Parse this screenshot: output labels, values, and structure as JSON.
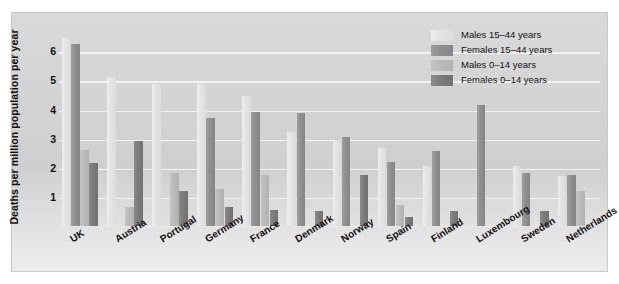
{
  "chart_data": {
    "type": "bar",
    "title": "",
    "xlabel": "",
    "ylabel": "Deaths per million population per year",
    "ylim": [
      0,
      6.8
    ],
    "yticks": [
      "1",
      "2",
      "3",
      "4",
      "5",
      "6"
    ],
    "grid": true,
    "legend_position": "top-right",
    "categories": [
      "UK",
      "Austria",
      "Portugal",
      "Germany",
      "France",
      "Denmark",
      "Norway",
      "Spain",
      "Finland",
      "Luxembourg",
      "Sweden",
      "Netherlands"
    ],
    "series": [
      {
        "name": "Males 15–44 years",
        "color": "#e4e4e4",
        "values": [
          6.5,
          5.15,
          4.9,
          4.9,
          4.5,
          3.25,
          3.0,
          2.7,
          2.1,
          null,
          2.1,
          1.75
        ]
      },
      {
        "name": "Females 15–44 years",
        "color": "#8f8f8f",
        "values": [
          6.3,
          null,
          null,
          3.75,
          3.95,
          3.9,
          3.1,
          2.25,
          2.6,
          4.2,
          1.85,
          1.8
        ]
      },
      {
        "name": "Males 0–14 years",
        "color": "#bababa",
        "values": [
          2.65,
          0.7,
          1.85,
          1.3,
          1.8,
          null,
          null,
          0.75,
          null,
          null,
          null,
          1.25
        ]
      },
      {
        "name": "Females 0–14 years",
        "color": "#7b7b7b",
        "values": [
          2.2,
          2.95,
          1.25,
          0.7,
          0.6,
          0.55,
          1.8,
          0.35,
          0.55,
          null,
          0.55,
          null
        ]
      }
    ]
  },
  "axis": {
    "y_title": "Deaths per million population per year"
  }
}
